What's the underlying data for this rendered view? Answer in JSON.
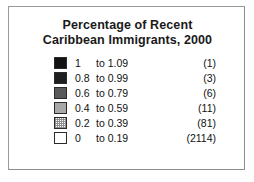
{
  "figure": {
    "background_color": "#ffffff",
    "frame_border_color": "#9a9a9a"
  },
  "title": {
    "line1": "Percentage of Recent",
    "line2": "Caribbean Immigrants, 2000"
  },
  "chart_data": {
    "type": "table",
    "title": "Percentage of Recent Caribbean Immigrants, 2000",
    "xlabel": "",
    "ylabel": "",
    "legend_position": "center",
    "grid": false,
    "columns": [
      "swatch",
      "range_low",
      "to",
      "range_high",
      "count"
    ],
    "categories": [
      "1 to 1.09",
      "0.8 to 0.99",
      "0.6 to 0.79",
      "0.4 to 0.59",
      "0.2 to 0.39",
      "0 to 0.19"
    ],
    "values": [
      1,
      3,
      6,
      11,
      81,
      2114
    ],
    "classes": [
      {
        "low": "1",
        "to": "to",
        "high": "1.09",
        "count": "(1)",
        "count_value": 1,
        "color": "#121212",
        "pattern": "solid"
      },
      {
        "low": "0.8",
        "to": "to",
        "high": "0.99",
        "count": "(3)",
        "count_value": 3,
        "color": "#1e1e1e",
        "pattern": "solid"
      },
      {
        "low": "0.6",
        "to": "to",
        "high": "0.79",
        "count": "(6)",
        "count_value": 6,
        "color": "#5a5a5a",
        "pattern": "solid"
      },
      {
        "low": "0.4",
        "to": "to",
        "high": "0.59",
        "count": "(11)",
        "count_value": 11,
        "color": "#a8a8a8",
        "pattern": "solid"
      },
      {
        "low": "0.2",
        "to": "to",
        "high": "0.39",
        "count": "(81)",
        "count_value": 81,
        "color": "#8f8f8f",
        "pattern": "dither-checker"
      },
      {
        "low": "0",
        "to": "to",
        "high": "0.19",
        "count": "(2114)",
        "count_value": 2114,
        "color": "#ffffff",
        "pattern": "solid"
      }
    ]
  }
}
